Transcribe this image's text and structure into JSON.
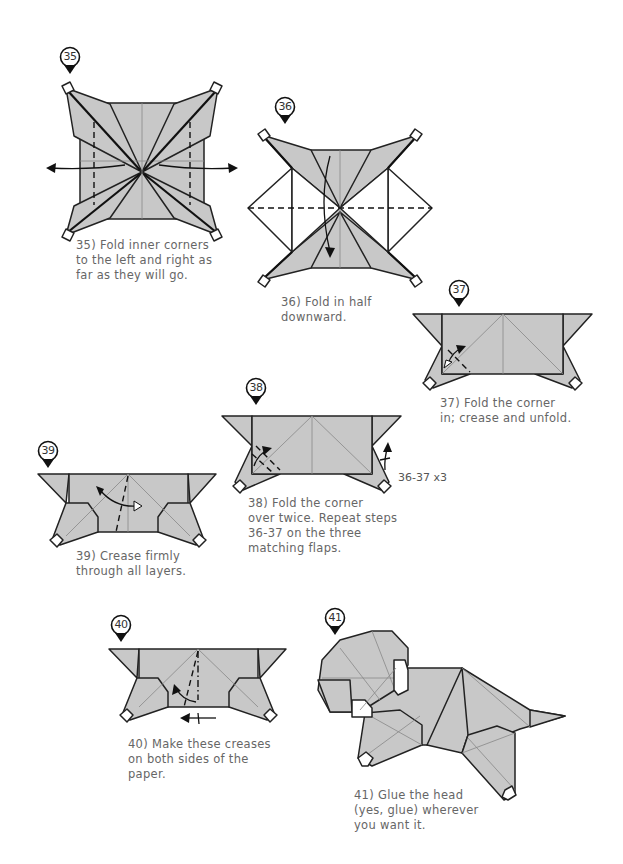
{
  "page": {
    "background": "#ffffff",
    "paper_color": "#c8c8c8",
    "line_color": "#222222",
    "text_color": "#666666"
  },
  "steps": [
    {
      "number": "35",
      "caption_lines": [
        "35) Fold inner corners",
        "to the left and right as",
        "far as they will go."
      ],
      "icons": [
        "step-marker-icon",
        "fold-arrow-left-icon",
        "fold-arrow-right-icon",
        "valley-fold-line"
      ]
    },
    {
      "number": "36",
      "caption_lines": [
        "36) Fold in half",
        "downward."
      ],
      "icons": [
        "step-marker-icon",
        "fold-arrow-down-icon",
        "valley-fold-line"
      ]
    },
    {
      "number": "37",
      "caption_lines": [
        "37) Fold the corner",
        "in; crease and unfold."
      ],
      "icons": [
        "step-marker-icon",
        "fold-unfold-arrow-icon"
      ]
    },
    {
      "number": "38",
      "caption_lines": [
        "38) Fold the corner",
        "over twice. Repeat steps",
        "36-37 on the three",
        "matching flaps."
      ],
      "annotation": "36-37 x3",
      "icons": [
        "step-marker-icon",
        "fold-over-twice-arrow-icon",
        "repeat-arrow-icon"
      ]
    },
    {
      "number": "39",
      "caption_lines": [
        "39) Crease firmly",
        "through all layers."
      ],
      "icons": [
        "step-marker-icon",
        "fold-unfold-arrow-icon"
      ]
    },
    {
      "number": "40",
      "caption_lines": [
        "40) Make these creases",
        "on both sides of the",
        "paper."
      ],
      "icons": [
        "step-marker-icon",
        "fold-arrow-icon",
        "turn-over-arrow-icon"
      ]
    },
    {
      "number": "41",
      "caption_lines": [
        "41) Glue the head",
        "(yes, glue) wherever",
        "you want it."
      ],
      "icons": [
        "step-marker-icon"
      ]
    }
  ]
}
